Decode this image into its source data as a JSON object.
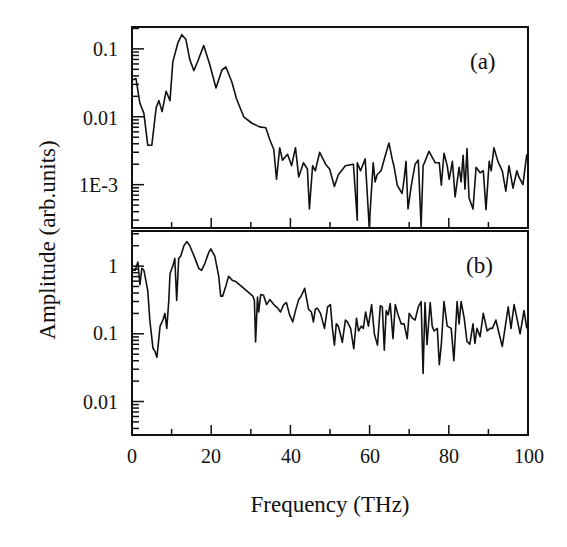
{
  "chart_data": [
    {
      "panel": "(a)",
      "type": "line",
      "title": "",
      "xlabel": "Frequency (THz)",
      "ylabel": "Amplitude (arb.units)",
      "yscale": "log",
      "xlim": [
        0,
        100
      ],
      "ylim": [
        0.00023,
        0.21
      ],
      "yticks": [
        0.1,
        0.01,
        0.001
      ],
      "ytick_labels": [
        "0.1",
        "0.01",
        "1E-3"
      ],
      "xticks": [
        0,
        20,
        40,
        60,
        80,
        100
      ],
      "grid": false,
      "legend": null,
      "annotation": "(a)",
      "series": [
        {
          "name": "(a)",
          "x": [
            0.0,
            1.0,
            2.0,
            3.0,
            4.0,
            5.0,
            6.1,
            6.8,
            7.6,
            8.6,
            9.6,
            10.3,
            11.6,
            12.6,
            13.6,
            14.6,
            15.6,
            16.6,
            18.1,
            19.6,
            21.2,
            22.7,
            23.7,
            25.2,
            26.4,
            28.2,
            30.2,
            32.2,
            33.8,
            34.8,
            35.8,
            36.5,
            37.3,
            38.0,
            39.3,
            40.3,
            41.3,
            42.1,
            43.3,
            44.3,
            44.8,
            45.6,
            46.3,
            47.4,
            48.9,
            49.9,
            51.1,
            52.1,
            53.9,
            55.9,
            56.9,
            56.9,
            57.7,
            58.9,
            59.9,
            60.9,
            61.4,
            61.9,
            62.9,
            63.9,
            64.9,
            65.7,
            66.2,
            67.0,
            68.2,
            68.7,
            69.2,
            69.7,
            70.5,
            71.5,
            72.3,
            73.0,
            73.5,
            74.0,
            75.0,
            76.6,
            77.6,
            78.1,
            78.8,
            79.6,
            80.1,
            80.9,
            81.6,
            82.6,
            83.1,
            83.6,
            84.1,
            84.6,
            85.1,
            86.1,
            86.9,
            87.9,
            88.7,
            89.4,
            90.2,
            90.7,
            91.4,
            92.4,
            93.5,
            94.4,
            95.2,
            96.2,
            97.2,
            97.7,
            98.7,
            99.7
          ],
          "y": [
            0.0344,
            0.0365,
            0.0158,
            0.0112,
            0.0038,
            0.0038,
            0.0137,
            0.0173,
            0.0119,
            0.0238,
            0.0173,
            0.0639,
            0.123,
            0.162,
            0.137,
            0.0696,
            0.0479,
            0.0652,
            0.112,
            0.0598,
            0.0265,
            0.0488,
            0.0541,
            0.0328,
            0.0184,
            0.01,
            0.0081,
            0.0071,
            0.0069,
            0.0046,
            0.0033,
            0.0012,
            0.0035,
            0.0023,
            0.0028,
            0.0019,
            0.0035,
            0.0013,
            0.0021,
            0.0017,
            0.00044,
            0.0019,
            0.0016,
            0.003,
            0.002,
            0.0017,
            0.00094,
            0.0014,
            0.0019,
            0.002,
            0.0003,
            0.0021,
            0.0016,
            0.0024,
            0.00024,
            0.0021,
            0.0011,
            0.0014,
            0.0016,
            0.0026,
            0.0041,
            0.0024,
            0.0018,
            0.00098,
            0.00074,
            0.0012,
            0.0022,
            0.00044,
            0.00095,
            0.002,
            0.0023,
            0.00024,
            0.0019,
            0.0022,
            0.0031,
            0.0021,
            0.0021,
            0.00098,
            0.0029,
            0.0019,
            0.0012,
            0.0022,
            0.00066,
            0.0018,
            0.0011,
            0.0027,
            0.00086,
            0.0034,
            0.00064,
            0.00044,
            0.0018,
            0.0015,
            0.0016,
            0.00043,
            0.0022,
            0.0016,
            0.0035,
            0.0022,
            0.0016,
            0.0008,
            0.0019,
            0.00089,
            0.0016,
            0.0013,
            0.001,
            0.0028,
            0.0031,
            0.00047,
            0.0016,
            0.0021,
            0.001
          ]
        }
      ]
    },
    {
      "panel": "(b)",
      "type": "line",
      "title": "",
      "xlabel": "Frequency (THz)",
      "ylabel": "Amplitude (arb.units)",
      "yscale": "log",
      "xlim": [
        0,
        100
      ],
      "ylim": [
        0.0032,
        3.3
      ],
      "yticks": [
        1,
        0.1,
        0.01
      ],
      "ytick_labels": [
        "1",
        "0.1",
        "0.01"
      ],
      "xticks": [
        0,
        20,
        40,
        60,
        80,
        100
      ],
      "xtick_labels": [
        "0",
        "20",
        "40",
        "60",
        "80",
        "100"
      ],
      "grid": false,
      "legend": null,
      "annotation": "(b)",
      "series": [
        {
          "name": "(b)",
          "x": [
            0.0,
            0.8,
            1.5,
            2.0,
            2.5,
            3.0,
            4.0,
            4.5,
            5.3,
            5.8,
            6.3,
            7.1,
            7.8,
            8.3,
            8.8,
            9.3,
            9.6,
            10.3,
            10.8,
            11.3,
            11.8,
            12.3,
            13.1,
            13.9,
            14.6,
            15.9,
            16.9,
            17.6,
            18.4,
            19.4,
            19.9,
            20.9,
            21.9,
            22.4,
            22.9,
            23.7,
            24.4,
            25.4,
            26.2,
            27.5,
            29.0,
            30.5,
            30.9,
            31.2,
            31.7,
            32.0,
            32.5,
            33.2,
            34.0,
            34.8,
            35.8,
            36.8,
            37.5,
            38.3,
            39.0,
            39.8,
            40.6,
            41.3,
            42.1,
            42.6,
            43.6,
            44.6,
            45.3,
            45.8,
            46.3,
            46.8,
            47.6,
            48.6,
            49.4,
            50.1,
            50.6,
            51.1,
            51.6,
            52.1,
            52.6,
            53.1,
            53.9,
            54.4,
            55.2,
            56.0,
            56.7,
            57.2,
            57.9,
            58.4,
            59.0,
            59.7,
            60.5,
            61.2,
            62.0,
            62.7,
            63.2,
            63.7,
            64.2,
            64.7,
            65.2,
            65.9,
            66.5,
            67.2,
            68.0,
            68.7,
            69.5,
            70.0,
            70.8,
            71.5,
            72.3,
            73.0,
            73.5,
            74.0,
            74.5,
            75.3,
            75.8,
            76.3,
            77.1,
            77.6,
            78.1,
            78.8,
            79.6,
            80.6,
            81.3,
            82.1,
            82.6,
            83.1,
            83.9,
            84.6,
            85.3,
            86.1,
            86.6,
            87.1,
            87.9,
            88.7,
            89.7,
            90.4,
            91.0,
            91.9,
            92.7,
            93.5,
            94.2,
            95.0,
            95.7,
            96.5,
            97.2,
            98.0,
            99.0,
            99.7
          ],
          "y": [
            0.87,
            0.87,
            1.15,
            0.53,
            0.93,
            0.87,
            0.43,
            0.16,
            0.061,
            0.055,
            0.045,
            0.13,
            0.16,
            0.2,
            0.12,
            0.31,
            0.77,
            1.0,
            1.3,
            0.31,
            1.3,
            1.4,
            2.0,
            2.3,
            2.0,
            1.3,
            0.92,
            0.87,
            1.1,
            1.6,
            1.8,
            1.4,
            0.71,
            0.36,
            0.36,
            0.51,
            0.71,
            0.61,
            0.59,
            0.51,
            0.43,
            0.36,
            0.31,
            0.076,
            0.35,
            0.21,
            0.38,
            0.37,
            0.27,
            0.32,
            0.27,
            0.24,
            0.21,
            0.27,
            0.29,
            0.19,
            0.15,
            0.22,
            0.32,
            0.35,
            0.47,
            0.23,
            0.21,
            0.15,
            0.23,
            0.24,
            0.2,
            0.12,
            0.25,
            0.27,
            0.12,
            0.068,
            0.14,
            0.13,
            0.1,
            0.075,
            0.16,
            0.15,
            0.12,
            0.06,
            0.17,
            0.11,
            0.13,
            0.12,
            0.21,
            0.13,
            0.27,
            0.099,
            0.068,
            0.26,
            0.25,
            0.057,
            0.22,
            0.19,
            0.28,
            0.085,
            0.27,
            0.19,
            0.14,
            0.14,
            0.085,
            0.2,
            0.17,
            0.16,
            0.25,
            0.3,
            0.026,
            0.29,
            0.069,
            0.29,
            0.13,
            0.11,
            0.12,
            0.035,
            0.069,
            0.3,
            0.13,
            0.12,
            0.04,
            0.3,
            0.14,
            0.3,
            0.17,
            0.077,
            0.07,
            0.14,
            0.072,
            0.12,
            0.091,
            0.2,
            0.11,
            0.12,
            0.12,
            0.16,
            0.1,
            0.065,
            0.12,
            0.25,
            0.12,
            0.27,
            0.17,
            0.1,
            0.22,
            0.12
          ]
        }
      ]
    }
  ],
  "labels": {
    "xlabel": "Frequency (THz)",
    "ylabel": "Amplitude (arb.units)",
    "panel_a": "(a)",
    "panel_b": "(b)",
    "x_ticks": [
      "0",
      "20",
      "40",
      "60",
      "80",
      "100"
    ],
    "a_y_ticks": [
      "0.1",
      "0.01",
      "1E-3"
    ],
    "b_y_ticks": [
      "1",
      "0.1",
      "0.01"
    ]
  },
  "colors": {
    "line": "#111111",
    "axes": "#111111",
    "background": "#ffffff"
  }
}
